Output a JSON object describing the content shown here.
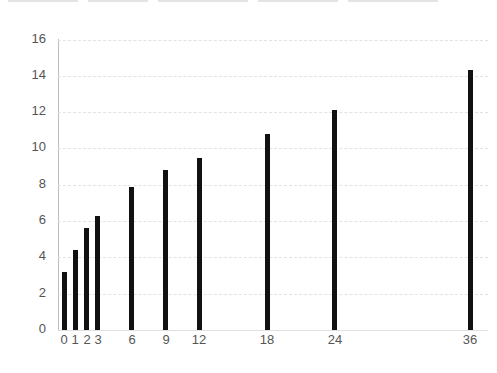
{
  "chart_data": {
    "type": "bar",
    "title": "",
    "xlabel": "",
    "ylabel": "",
    "x": [
      0,
      1,
      2,
      3,
      6,
      9,
      12,
      18,
      24,
      36
    ],
    "categories": [
      "0",
      "1",
      "2",
      "3",
      "6",
      "9",
      "12",
      "18",
      "24",
      "36"
    ],
    "values": [
      3.2,
      4.4,
      5.6,
      6.3,
      7.9,
      8.8,
      9.5,
      10.8,
      12.1,
      14.3
    ],
    "ylim": [
      0,
      16
    ],
    "yticks": [
      "0",
      "2",
      "4",
      "6",
      "8",
      "10",
      "12",
      "14",
      "16"
    ],
    "grid": true,
    "bar_color": "#111111",
    "legend": "none"
  }
}
